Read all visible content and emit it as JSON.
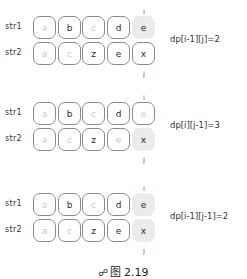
{
  "row_labels": {
    "str1": "str1",
    "str2": "str2"
  },
  "index_labels": {
    "i": "i",
    "j": "j"
  },
  "panels": [
    {
      "formula": "dp[i-1][j]=2",
      "str1": [
        {
          "ch": "a",
          "faded": true,
          "hl": false
        },
        {
          "ch": "b",
          "faded": false,
          "hl": false
        },
        {
          "ch": "c",
          "faded": true,
          "hl": false
        },
        {
          "ch": "d",
          "faded": false,
          "hl": false
        },
        {
          "ch": "e",
          "faded": false,
          "hl": true
        }
      ],
      "str2": [
        {
          "ch": "a",
          "faded": true,
          "hl": false
        },
        {
          "ch": "c",
          "faded": true,
          "hl": false
        },
        {
          "ch": "z",
          "faded": false,
          "hl": false
        },
        {
          "ch": "e",
          "faded": false,
          "hl": false
        },
        {
          "ch": "x",
          "faded": false,
          "hl": false
        }
      ]
    },
    {
      "formula": "dp[i][j-1]=3",
      "str1": [
        {
          "ch": "a",
          "faded": true,
          "hl": false
        },
        {
          "ch": "b",
          "faded": false,
          "hl": false
        },
        {
          "ch": "c",
          "faded": true,
          "hl": false
        },
        {
          "ch": "d",
          "faded": false,
          "hl": false
        },
        {
          "ch": "e",
          "faded": true,
          "hl": false
        }
      ],
      "str2": [
        {
          "ch": "a",
          "faded": true,
          "hl": false
        },
        {
          "ch": "c",
          "faded": true,
          "hl": false
        },
        {
          "ch": "z",
          "faded": false,
          "hl": false
        },
        {
          "ch": "e",
          "faded": true,
          "hl": false
        },
        {
          "ch": "x",
          "faded": false,
          "hl": true
        }
      ]
    },
    {
      "formula": "dp[i-1][j-1]=2",
      "str1": [
        {
          "ch": "a",
          "faded": true,
          "hl": false
        },
        {
          "ch": "b",
          "faded": false,
          "hl": false
        },
        {
          "ch": "c",
          "faded": true,
          "hl": false
        },
        {
          "ch": "d",
          "faded": false,
          "hl": false
        },
        {
          "ch": "e",
          "faded": false,
          "hl": true
        }
      ],
      "str2": [
        {
          "ch": "a",
          "faded": true,
          "hl": false
        },
        {
          "ch": "c",
          "faded": true,
          "hl": false
        },
        {
          "ch": "z",
          "faded": false,
          "hl": false
        },
        {
          "ch": "e",
          "faded": false,
          "hl": false
        },
        {
          "ch": "x",
          "faded": false,
          "hl": true
        }
      ]
    }
  ],
  "caption": {
    "icon": "figure-icon",
    "text": "图 2.19"
  }
}
